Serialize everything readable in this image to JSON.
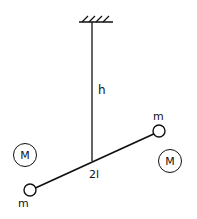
{
  "diagram": {
    "labels": {
      "height": "h",
      "rod_length": "2l",
      "small_mass_top": "m",
      "small_mass_bottom": "m",
      "large_mass_left": "M",
      "large_mass_right": "M"
    },
    "colors": {
      "ink": "#111111",
      "background": "#ffffff"
    }
  }
}
